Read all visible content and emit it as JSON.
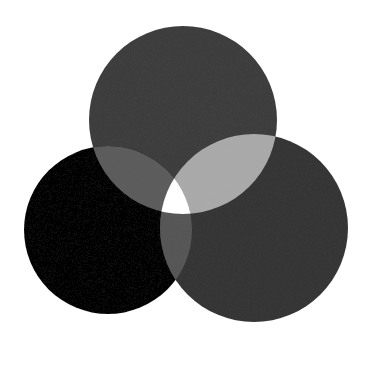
{
  "image": {
    "description": "Three overlapping watercolor circles in grayscale forming a Venn-like diagram",
    "background": "#ffffff"
  },
  "circles": [
    {
      "name": "top",
      "cx": 183,
      "cy": 120,
      "r": 94,
      "color": "#3d3d3d"
    },
    {
      "name": "left",
      "cx": 108,
      "cy": 230,
      "r": 84,
      "color": "#050505"
    },
    {
      "name": "right",
      "cx": 254,
      "cy": 228,
      "r": 94,
      "color": "#343434"
    }
  ],
  "overlaps": {
    "top_left": "#5c5c5c",
    "top_right": "#a9a9a9",
    "left_right": "#565656",
    "center": "#ffffff"
  }
}
